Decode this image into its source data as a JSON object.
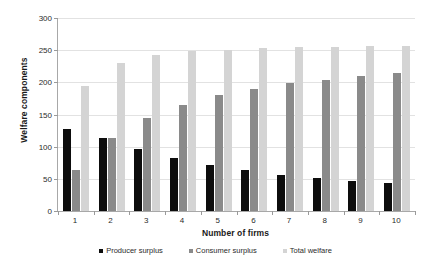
{
  "chart_data": {
    "type": "bar",
    "title": "",
    "xlabel": "Number of firms",
    "ylabel": "Welfare components",
    "categories": [
      "1",
      "2",
      "3",
      "4",
      "5",
      "6",
      "7",
      "8",
      "9",
      "10"
    ],
    "ylim": [
      0,
      300
    ],
    "yticks": [
      0,
      50,
      100,
      150,
      200,
      250,
      300
    ],
    "ytick_labels": [
      "0",
      "50",
      "100",
      "150",
      "200",
      "250",
      "300"
    ],
    "grid": true,
    "legend_position": "bottom",
    "series": [
      {
        "name": "Producer surplus",
        "color": "#0d0d0d",
        "values": [
          128,
          114,
          97,
          82,
          71,
          63,
          56,
          51,
          46,
          43
        ]
      },
      {
        "name": "Consumer surplus",
        "color": "#8a8a8a",
        "values": [
          64,
          114,
          145,
          165,
          180,
          190,
          199,
          204,
          210,
          214
        ]
      },
      {
        "name": "Total welfare",
        "color": "#d4d4d4",
        "values": [
          194,
          230,
          242,
          248,
          251,
          253,
          255,
          255,
          256,
          257
        ]
      }
    ]
  }
}
